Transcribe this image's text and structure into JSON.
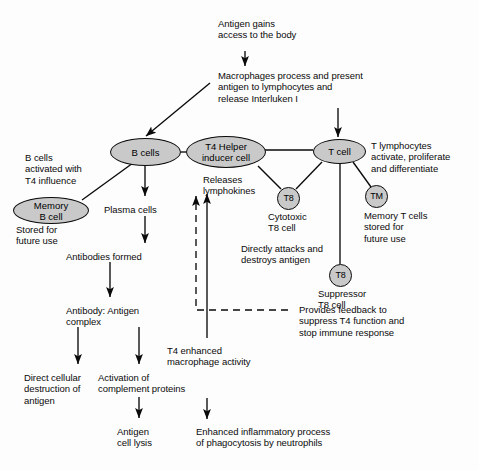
{
  "diagram": {
    "kind": "flowchart",
    "cropped_title": "",
    "colors": {
      "node_fill": "#c9c9c9",
      "stroke": "#0a0a0a",
      "text": "#0b0b0b",
      "background": "#fdfdfd"
    }
  },
  "nodes": {
    "b_cells": "B cells",
    "t4_helper": "T4 Helper\ninducer cell",
    "t_cell": "T cell",
    "memory_b": "Memory\nB cell",
    "cytotoxic_t8": "T8",
    "memory_t": "TM",
    "suppressor_t8": "T8"
  },
  "labels": {
    "antigen_entry": "Antigen gains\naccess to the body",
    "macrophage_process": "Macrophages process and present\nantigen to lymphocytes and\nrelease Interluken I",
    "b_activated": "B cells\nactivated with\nT4 influence",
    "memory_b_note": "Stored for\nfuture use",
    "plasma_cells": "Plasma cells",
    "releases_lymphokines": "Releases\nlymphokines",
    "t_lymphocytes": "T lymphocytes\nactivate, proliferate\nand differentiate",
    "cytotoxic_caption": "Cytotoxic\nT8 cell",
    "memory_t_note": "Memory T cells\nstored for\nfuture use",
    "directly_attacks": "Directly attacks and\ndestroys antigen",
    "antibodies_formed": "Antibodies formed",
    "suppressor_caption": "Suppressor\nT8 cell",
    "feedback": "Provides feedback to\nsuppress T4 function and\nstop immune response",
    "antibody_antigen": "Antibody: Antigen\ncomplex",
    "t4_enhanced": "T4 enhanced\nmacrophage activity",
    "direct_destruction": "Direct cellular\ndestruction of\nantigen",
    "activation_complement": "Activation of\ncomplement proteins",
    "antigen_cell_lysis": "Antigen\ncell lysis",
    "enhanced_inflammatory": "Enhanced inflammatory process\nof phagocytosis by neutrophils"
  }
}
